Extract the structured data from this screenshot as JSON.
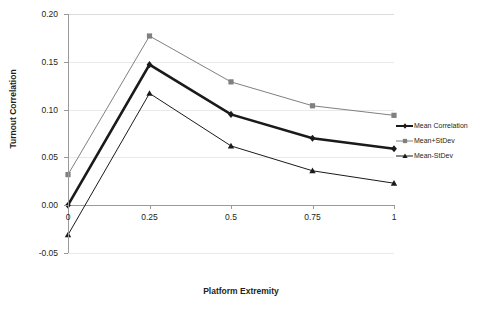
{
  "chart_data": {
    "type": "line",
    "title": "",
    "xlabel": "Platform Extremity",
    "ylabel": "Turnout Correlation",
    "x": [
      0,
      0.25,
      0.5,
      0.75,
      1
    ],
    "categories": [
      "0",
      "0.25",
      "0.5",
      "0.75",
      "1"
    ],
    "xtick_labels": [
      "0",
      "0.25",
      "0.5",
      "0.75",
      "1"
    ],
    "ytick_labels": [
      "0.20",
      "0.15",
      "0.10",
      "0.05",
      "0.00",
      "-0.05"
    ],
    "ytick_values": [
      0.2,
      0.15,
      0.1,
      0.05,
      0.0,
      -0.05
    ],
    "ylim": [
      -0.05,
      0.2
    ],
    "grid": true,
    "legend_position": "right",
    "series": [
      {
        "name": "Mean Correlation",
        "values": [
          0.0,
          0.147,
          0.095,
          0.07,
          0.059
        ],
        "color": "#1a1a1a",
        "marker": "diamond",
        "line_width": 2.6
      },
      {
        "name": "Mean+StDev",
        "values": [
          0.032,
          0.177,
          0.129,
          0.104,
          0.094
        ],
        "color": "#808080",
        "marker": "square",
        "line_width": 1.0
      },
      {
        "name": "Mean-StDev",
        "values": [
          -0.031,
          0.117,
          0.062,
          0.036,
          0.023
        ],
        "color": "#1a1a1a",
        "marker": "triangle",
        "line_width": 1.0
      }
    ]
  },
  "legend": {
    "items": [
      {
        "label": "Mean Correlation"
      },
      {
        "label": "Mean+StDev"
      },
      {
        "label": "Mean-StDev"
      }
    ]
  },
  "axes": {
    "x_title": "Platform Extremity",
    "y_title": "Turnout Correlation"
  }
}
